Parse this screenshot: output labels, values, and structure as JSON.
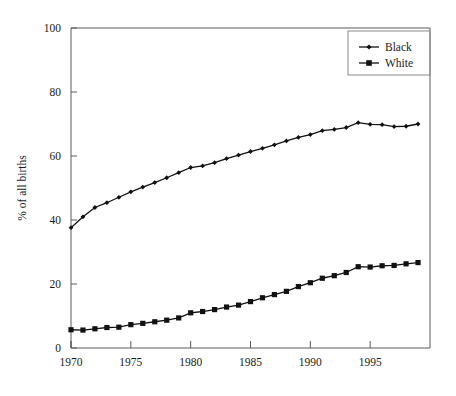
{
  "figure": {
    "background_color": "#ffffff",
    "frame_color": "#5a5a5a",
    "series_color": "#111111"
  },
  "chart_data": {
    "type": "line",
    "title": "",
    "subtitle": "",
    "xlabel": "",
    "ylabel": "% of all births",
    "xlim": [
      1970,
      2000
    ],
    "ylim": [
      0,
      100
    ],
    "xticks": [
      1970,
      1975,
      1980,
      1985,
      1990,
      1995
    ],
    "xtick_labels": [
      "1970",
      "1975",
      "1980",
      "1985",
      "1990",
      "1995"
    ],
    "yticks": [
      0,
      20,
      40,
      60,
      80,
      100
    ],
    "ytick_labels": [
      "0",
      "20",
      "40",
      "60",
      "80",
      "100"
    ],
    "grid": false,
    "legend_position": "upper right",
    "legend_entries": [
      "Black",
      "White"
    ],
    "x": [
      1970,
      1971,
      1972,
      1973,
      1974,
      1975,
      1976,
      1977,
      1978,
      1979,
      1980,
      1981,
      1982,
      1983,
      1984,
      1985,
      1986,
      1987,
      1988,
      1989,
      1990,
      1991,
      1992,
      1993,
      1994,
      1995,
      1996,
      1997,
      1998,
      1999
    ],
    "series": [
      {
        "name": "Black",
        "marker": "diamond",
        "values": [
          37.6,
          41.0,
          43.9,
          45.4,
          47.1,
          48.8,
          50.3,
          51.7,
          53.2,
          54.8,
          56.4,
          56.9,
          57.9,
          59.2,
          60.3,
          61.4,
          62.4,
          63.5,
          64.7,
          65.8,
          66.7,
          67.9,
          68.3,
          68.9,
          70.4,
          69.9,
          69.8,
          69.2,
          69.3,
          70.0
        ]
      },
      {
        "name": "White",
        "marker": "square",
        "values": [
          5.7,
          5.6,
          6.0,
          6.4,
          6.5,
          7.3,
          7.7,
          8.2,
          8.7,
          9.4,
          11.0,
          11.4,
          12.0,
          12.8,
          13.4,
          14.5,
          15.7,
          16.7,
          17.7,
          19.2,
          20.4,
          21.8,
          22.6,
          23.6,
          25.4,
          25.3,
          25.7,
          25.8,
          26.3,
          26.7
        ]
      }
    ]
  },
  "axis": {
    "y_title": "% of all births"
  }
}
